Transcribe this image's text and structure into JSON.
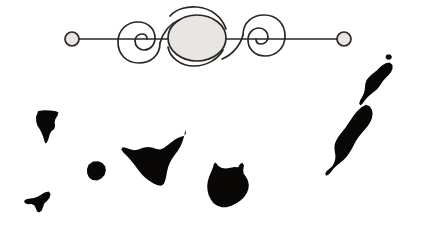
{
  "page": {
    "kind": "map-illustration",
    "background_color": "#ffffff",
    "ink_color": "#090807",
    "ornament_color": "#2a2724",
    "ornament_fill_color": "#e8e6e3",
    "width": 427,
    "height": 227
  },
  "ornament": {
    "name": "scrollwork-divider",
    "description": "Horizontal rule with double spiral flourish and circular end terminals",
    "rule_y": 39,
    "left_terminal": {
      "cx": 72,
      "cy": 39,
      "r": 7
    },
    "right_terminal": {
      "cx": 344,
      "cy": 39,
      "r": 7
    },
    "rule_start_x": 79,
    "rule_end_x": 337,
    "left_spiral": {
      "cx": 140,
      "cy": 39,
      "r": 22
    },
    "center_ellipse": {
      "cx": 197,
      "cy": 38,
      "rx": 29,
      "ry": 23
    },
    "right_spiral": {
      "cx": 263,
      "cy": 39,
      "r": 22
    }
  },
  "map": {
    "name": "canary-islands-silhouette",
    "title": "Canary Islands",
    "islands": [
      {
        "id": "la-palma",
        "label": "La Palma",
        "bbox": [
          36,
          110,
          59,
          144
        ],
        "path": "M38.2,111.0 L44.0,110.2 L50.5,110.4 L56.0,111.2 L58.4,112.6 L57.6,115.4 L55.4,119.0 L54.6,122.6 L55.2,126.0 L54.0,129.2 L51.6,131.0 L49.8,134.0 L48.6,138.4 L47.0,142.6 L45.4,143.4 L44.2,140.4 L43.0,136.2 L41.4,132.4 L39.6,129.0 L37.4,125.6 L36.2,121.4 L36.0,116.8 Z"
      },
      {
        "id": "la-gomera",
        "label": "La Gomera",
        "bbox": [
          87,
          161,
          106,
          181
        ],
        "path": "M93.0,161.6 L98.2,161.2 L102.4,163.0 L105.2,166.4 L105.8,170.6 L104.6,175.0 L101.4,178.6 L97.0,180.4 L92.4,180.0 L89.0,177.4 L87.2,173.6 L87.0,169.0 L88.6,164.8 Z"
      },
      {
        "id": "el-hierro",
        "label": "El Hierro",
        "bbox": [
          24,
          191,
          51,
          213
        ],
        "path": "M48.8,191.4 L50.6,194.0 L49.6,197.8 L47.0,201.0 L44.2,203.6 L43.0,207.2 L41.6,210.8 L39.2,212.6 L37.0,211.4 L35.8,208.2 L34.2,205.2 L31.4,204.0 L28.0,204.2 L25.0,203.2 L24.0,201.0 L26.2,199.2 L30.0,198.4 L34.0,198.0 L37.6,196.8 L41.0,194.8 L44.6,192.6 Z"
      },
      {
        "id": "tenerife",
        "label": "Tenerife",
        "bbox": [
          121,
          129,
          186,
          186
        ],
        "path": "M185.2,130.0 L186.0,133.4 L183.6,136.0 L179.4,137.2 L175.0,139.4 L171.0,142.4 L167.2,145.6 L163.8,148.0 L160.2,149.4 L156.4,149.0 L152.2,147.6 L147.6,147.0 L143.0,147.8 L138.4,149.4 L134.0,150.2 L130.0,149.2 L126.0,147.8 L122.6,147.2 L121.2,149.4 L123.4,152.6 L127.0,156.0 L130.4,159.8 L133.6,163.8 L136.6,167.8 L139.4,171.6 L142.4,175.0 L145.8,178.2 L149.6,181.0 L153.6,183.4 L157.6,185.2 L161.2,185.8 L163.8,184.0 L165.2,180.6 L166.2,176.4 L167.0,171.8 L168.2,167.0 L170.0,162.4 L172.4,158.2 L175.2,154.2 L178.0,150.4 L180.4,146.4 L182.2,142.2 L183.6,138.0 L184.6,134.0 Z"
      },
      {
        "id": "gran-canaria",
        "label": "Gran Canaria",
        "bbox": [
          207,
          162,
          249,
          208
        ],
        "path": "M215.6,162.4 L218.4,166.0 L221.8,168.0 L226.0,168.4 L230.4,167.8 L234.6,167.0 L238.2,167.2 L240.0,164.0 L242.4,162.8 L244.0,165.6 L243.2,169.6 L243.6,173.4 L245.8,176.6 L247.8,180.2 L248.8,184.4 L248.4,189.0 L246.6,193.4 L243.8,197.4 L240.2,200.8 L236.0,203.6 L231.4,205.8 L226.6,207.2 L221.8,207.2 L217.4,205.8 L213.6,203.2 L210.8,199.6 L208.8,195.4 L207.6,190.8 L207.2,186.0 L207.8,181.2 L209.2,176.6 L211.0,172.2 L212.8,167.8 L214.0,163.8 Z"
      },
      {
        "id": "fuerteventura",
        "label": "Fuerteventura",
        "bbox": [
          325,
          104,
          374,
          176
        ],
        "path": "M366.0,104.8 L369.6,106.2 L371.8,109.4 L372.6,113.6 L372.0,118.0 L370.2,122.2 L367.6,126.2 L364.6,129.8 L361.4,133.4 L358.4,137.2 L355.8,141.2 L353.6,145.4 L351.4,149.6 L349.0,153.6 L346.2,157.2 L343.0,160.4 L339.6,163.2 L336.2,166.0 L333.2,169.0 L330.8,172.2 L328.4,174.8 L326.0,175.8 L325.2,173.4 L327.0,170.8 L329.8,168.6 L332.4,166.0 L334.2,162.8 L335.2,159.2 L335.4,155.4 L334.8,151.6 L334.4,147.8 L334.8,144.0 L336.2,140.4 L338.2,137.0 L340.6,133.8 L343.2,130.6 L345.8,127.2 L348.2,123.6 L350.6,120.0 L353.0,116.4 L355.6,113.0 L358.4,110.0 L361.4,107.2 Z"
      },
      {
        "id": "lanzarote",
        "label": "Lanzarote",
        "bbox": [
          359,
          62,
          393,
          106
        ],
        "path": "M389.6,62.4 L392.4,64.8 L392.6,68.6 L391.0,72.2 L388.4,75.2 L385.6,78.0 L383.0,81.0 L380.8,84.2 L378.6,87.4 L376.0,90.2 L373.0,92.6 L370.0,95.0 L367.2,97.6 L364.8,100.6 L362.6,103.6 L360.4,105.6 L359.2,103.4 L360.2,100.2 L362.0,97.2 L363.6,94.0 L364.6,90.6 L365.0,87.0 L365.4,83.4 L366.6,80.0 L368.8,77.2 L371.4,74.8 L374.2,72.6 L377.0,70.2 L379.6,67.6 L382.4,65.2 L385.6,63.2 Z"
      },
      {
        "id": "la-graciosa",
        "label": "La Graciosa",
        "bbox": [
          385,
          54,
          392,
          60
        ],
        "path": "M387.4,54.4 L390.4,54.6 L391.8,56.4 L391.4,58.6 L389.6,59.8 L387.0,59.4 L385.6,57.6 L386.0,55.4 Z"
      }
    ]
  }
}
